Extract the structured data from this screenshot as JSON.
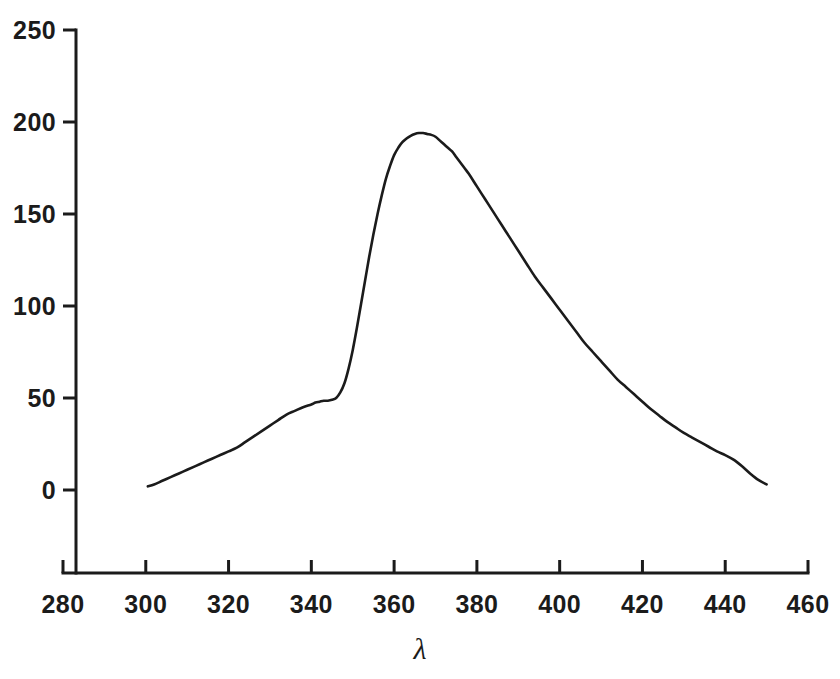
{
  "figure": {
    "background_color": "#ffffff",
    "line_color": "#1b1b1b",
    "axis_color": "#1b1b1b"
  },
  "chart_data": {
    "type": "line",
    "title": "",
    "subtitle": "",
    "xlabel": "λ",
    "ylabel": "",
    "xlim": [
      280,
      460
    ],
    "ylim": [
      0,
      250
    ],
    "xticks": [
      280,
      300,
      320,
      340,
      360,
      380,
      400,
      420,
      440,
      460
    ],
    "yticks": [
      0,
      50,
      100,
      150,
      200,
      250
    ],
    "xtick_labels": [
      "280",
      "300",
      "320",
      "340",
      "360",
      "380",
      "400",
      "420",
      "440",
      "460"
    ],
    "ytick_labels": [
      "0",
      "50",
      "100",
      "150",
      "200",
      "250"
    ],
    "grid": false,
    "legend": null,
    "legend_position": "none",
    "axis_style": "left-and-bottom-spines-only",
    "annotations": [],
    "series": [
      {
        "name": "emission",
        "line_width": 2.6,
        "color": "#1b1b1b",
        "x": [
          300.5,
          302,
          304,
          306,
          308,
          310,
          312,
          314,
          316,
          318,
          320,
          322,
          324,
          326,
          328,
          330,
          332,
          334,
          336,
          338,
          340,
          341,
          342,
          343,
          344,
          345,
          346,
          347,
          348,
          349,
          350,
          351,
          352,
          353,
          354,
          355,
          356,
          357,
          358,
          359,
          360,
          361,
          362,
          363,
          364,
          365,
          366,
          367,
          368,
          369,
          370,
          371,
          372,
          373,
          374,
          375,
          376,
          377,
          378,
          380,
          382,
          384,
          386,
          388,
          390,
          392,
          394,
          396,
          398,
          400,
          402,
          404,
          406,
          408,
          410,
          412,
          414,
          416,
          418,
          420,
          422,
          424,
          426,
          428,
          430,
          432,
          434,
          436,
          438,
          440,
          442,
          444,
          446,
          448,
          450
        ],
        "y": [
          2,
          3,
          5,
          7,
          9,
          11,
          13,
          15,
          17,
          19,
          21,
          23,
          26,
          29,
          32,
          35,
          38,
          41,
          43,
          45,
          46.5,
          47.5,
          48,
          48.5,
          48.5,
          49,
          50,
          53,
          58,
          66,
          76,
          88,
          101,
          114,
          127,
          139,
          150,
          160,
          169,
          176,
          182,
          186,
          189,
          191,
          192.5,
          193.5,
          194,
          194,
          193.5,
          193,
          192,
          190,
          188,
          186,
          184,
          181,
          178,
          175,
          172,
          165,
          158,
          151,
          144,
          137,
          130,
          123,
          116,
          110,
          104,
          98,
          92,
          86,
          80,
          75,
          70,
          65,
          60,
          56,
          52,
          48,
          44,
          40.5,
          37,
          34,
          31,
          28.5,
          26,
          23.5,
          21,
          19,
          16.5,
          13,
          9,
          5.5,
          3
        ]
      }
    ]
  },
  "axes": {
    "y_ticks": [
      {
        "label": "250",
        "value": 250
      },
      {
        "label": "200",
        "value": 200
      },
      {
        "label": "150",
        "value": 150
      },
      {
        "label": "100",
        "value": 100
      },
      {
        "label": "50",
        "value": 50
      },
      {
        "label": "0",
        "value": 0
      }
    ],
    "x_ticks": [
      {
        "label": "280",
        "value": 280
      },
      {
        "label": "300",
        "value": 300
      },
      {
        "label": "320",
        "value": 320
      },
      {
        "label": "340",
        "value": 340
      },
      {
        "label": "360",
        "value": 360
      },
      {
        "label": "380",
        "value": 380
      },
      {
        "label": "400",
        "value": 400
      },
      {
        "label": "420",
        "value": 420
      },
      {
        "label": "440",
        "value": 440
      },
      {
        "label": "460",
        "value": 460
      }
    ],
    "x_axis_title": "λ"
  }
}
